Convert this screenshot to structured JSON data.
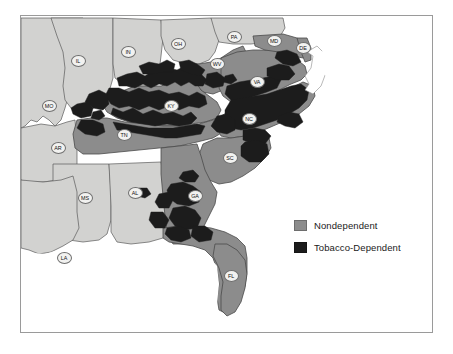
{
  "figure": {
    "frame_border_color": "#9a9a9a",
    "background_color": "#ffffff"
  },
  "legend": {
    "position": "middle-right",
    "items": [
      {
        "label": "Nondependent",
        "color": "#8c8c8c",
        "swatch_name": "nondependent-swatch"
      },
      {
        "label": "Tobacco-Dependent",
        "color": "#1c1c1c",
        "swatch_name": "tobacco-dependent-swatch"
      }
    ]
  },
  "map": {
    "projection": "southeastern United States",
    "ocean_color": "#ffffff",
    "outside_study_area_color": "#d2d2d0",
    "study_area_color": "#8c8c8c",
    "tobacco_dependent_color": "#1c1c1c",
    "boundary_color": "#555555",
    "state_labels": [
      {
        "abbr": "IL",
        "x": 57,
        "y": 45
      },
      {
        "abbr": "IN",
        "x": 107,
        "y": 36
      },
      {
        "abbr": "OH",
        "x": 157,
        "y": 28
      },
      {
        "abbr": "PA",
        "x": 213,
        "y": 21
      },
      {
        "abbr": "MD",
        "x": 253,
        "y": 25
      },
      {
        "abbr": "DE",
        "x": 282,
        "y": 32
      },
      {
        "abbr": "WV",
        "x": 196,
        "y": 48
      },
      {
        "abbr": "MO",
        "x": 28,
        "y": 90
      },
      {
        "abbr": "KY",
        "x": 150,
        "y": 90
      },
      {
        "abbr": "VA",
        "x": 236,
        "y": 66
      },
      {
        "abbr": "NC",
        "x": 228,
        "y": 103
      },
      {
        "abbr": "TN",
        "x": 103,
        "y": 119
      },
      {
        "abbr": "AR",
        "x": 37,
        "y": 132
      },
      {
        "abbr": "SC",
        "x": 209,
        "y": 142
      },
      {
        "abbr": "MS",
        "x": 64,
        "y": 182
      },
      {
        "abbr": "AL",
        "x": 114,
        "y": 177
      },
      {
        "abbr": "GA",
        "x": 174,
        "y": 180
      },
      {
        "abbr": "LA",
        "x": 43,
        "y": 242
      },
      {
        "abbr": "FL",
        "x": 210,
        "y": 260
      }
    ]
  }
}
